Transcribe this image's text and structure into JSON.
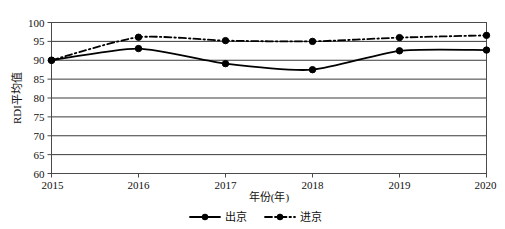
{
  "chart_data": {
    "type": "line",
    "title": "",
    "subtitle": "",
    "xlabel": "年份(年)",
    "ylabel": "RDI平均值",
    "x": [
      2015,
      2016,
      2017,
      2018,
      2019,
      2020
    ],
    "xtick_labels": [
      "2015",
      "2016",
      "2017",
      "2018",
      "2019",
      "2020"
    ],
    "ytick_labels": [
      "60",
      "65",
      "70",
      "75",
      "80",
      "85",
      "90",
      "95",
      "100"
    ],
    "yticks": [
      60,
      65,
      70,
      75,
      80,
      85,
      90,
      95,
      100
    ],
    "ylim": [
      60,
      100
    ],
    "xlim": [
      2015,
      2020
    ],
    "grid": "horizontal",
    "legend_position": "bottom",
    "series": [
      {
        "name": "出京",
        "values": [
          90.0,
          93.1,
          89.1,
          87.5,
          92.5,
          92.7
        ],
        "line_style": "solid",
        "marker": "circle",
        "color": "#000000"
      },
      {
        "name": "进京",
        "values": [
          90.0,
          96.1,
          95.2,
          95.0,
          96.0,
          96.6
        ],
        "line_style": "dash-dot",
        "marker": "circle",
        "color": "#000000"
      }
    ]
  },
  "legend": {
    "items": [
      {
        "label": "出京",
        "style": "solid"
      },
      {
        "label": "进京",
        "style": "dash-dot"
      }
    ]
  },
  "axes": {
    "y_title": "RDI平均值",
    "x_title": "年份(年)"
  },
  "colors": {
    "line": "#000000",
    "grid": "#3a3a3a",
    "frame": "#4a4a4a",
    "background": "#ffffff"
  }
}
